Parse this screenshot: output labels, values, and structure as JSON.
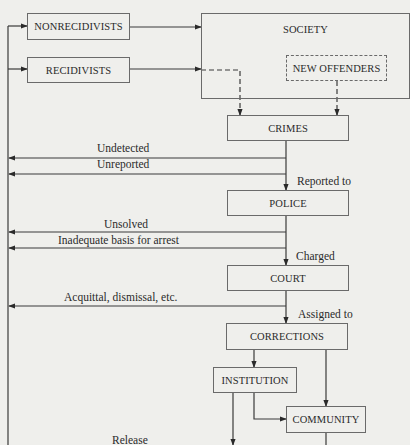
{
  "diagram": {
    "type": "flowchart",
    "nodes": {
      "nonrecidivists": "NONRECIDIVISTS",
      "recidivists": "RECIDIVISTS",
      "society": "SOCIETY",
      "new_offenders": "NEW OFFENDERS",
      "crimes": "CRIMES",
      "police": "POLICE",
      "court": "COURT",
      "corrections": "CORRECTIONS",
      "institution": "INSTITUTION",
      "community": "COMMUNITY"
    },
    "edge_labels": {
      "undetected": "Undetected",
      "unreported": "Unreported",
      "reported_to": "Reported to",
      "unsolved": "Unsolved",
      "inadequate": "Inadequate basis for arrest",
      "charged": "Charged",
      "acquittal": "Acquittal, dismissal, etc.",
      "assigned_to": "Assigned to",
      "release": "Release"
    },
    "edges": [
      {
        "from": "NONRECIDIVISTS",
        "to": "SOCIETY",
        "style": "solid"
      },
      {
        "from": "RECIDIVISTS",
        "to": "SOCIETY",
        "style": "solid"
      },
      {
        "from": "RECIDIVISTS",
        "to": "CRIMES",
        "style": "dashed"
      },
      {
        "from": "NEW OFFENDERS",
        "to": "CRIMES",
        "style": "dashed"
      },
      {
        "from": "CRIMES",
        "to": "RETURN",
        "label": "Undetected"
      },
      {
        "from": "CRIMES",
        "to": "RETURN",
        "label": "Unreported"
      },
      {
        "from": "CRIMES",
        "to": "POLICE",
        "label": "Reported to"
      },
      {
        "from": "POLICE",
        "to": "RETURN",
        "label": "Unsolved"
      },
      {
        "from": "POLICE",
        "to": "RETURN",
        "label": "Inadequate basis for arrest"
      },
      {
        "from": "POLICE",
        "to": "COURT",
        "label": "Charged"
      },
      {
        "from": "COURT",
        "to": "RETURN",
        "label": "Acquittal, dismissal, etc."
      },
      {
        "from": "COURT",
        "to": "CORRECTIONS",
        "label": "Assigned to"
      },
      {
        "from": "CORRECTIONS",
        "to": "INSTITUTION"
      },
      {
        "from": "CORRECTIONS",
        "to": "COMMUNITY"
      },
      {
        "from": "INSTITUTION",
        "to": "COMMUNITY"
      },
      {
        "from": "INSTITUTION",
        "to": "RETURN",
        "label": "Release"
      },
      {
        "from": "COMMUNITY",
        "to": "RETURN"
      },
      {
        "from": "RETURN",
        "to": "NONRECIDIVISTS"
      },
      {
        "from": "RETURN",
        "to": "RECIDIVISTS"
      }
    ]
  },
  "colors": {
    "background": "#efefec",
    "line": "#3a3a3a",
    "box_border": "#6a6a6a",
    "text": "#2a2a2a"
  }
}
